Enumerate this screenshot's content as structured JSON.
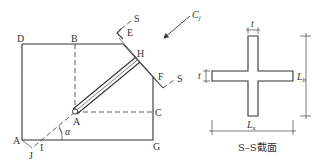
{
  "left_figure": {
    "points": {
      "D": "D",
      "B": "B",
      "E": "E",
      "H": "H",
      "F": "F",
      "C": "C",
      "A_center": "A",
      "A_corner": "A",
      "I": "I",
      "J": "J",
      "G": "G"
    },
    "angle_label": "α",
    "section_marks": [
      "S",
      "S"
    ],
    "load_label": "C",
    "load_subscript": "j"
  },
  "right_figure": {
    "thickness_top": "t",
    "thickness_left": "t",
    "dim_vertical": "L",
    "dim_vertical_sub": "b",
    "dim_horizontal": "L",
    "dim_horizontal_sub": "x",
    "caption": "S–S截面"
  }
}
